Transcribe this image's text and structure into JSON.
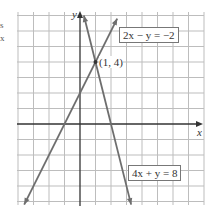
{
  "edge_fragments": [
    "s",
    "x"
  ],
  "colors": {
    "grid": "#bdbdbd",
    "axis": "#333333",
    "line": "#6e6e6e",
    "background": "#ffffff"
  },
  "chart_data": {
    "type": "line",
    "title": "",
    "xlabel": "x",
    "ylabel": "y",
    "xlim": [
      -4,
      8
    ],
    "ylim": [
      -5,
      7
    ],
    "grid": true,
    "series": [
      {
        "name": "2x − y = −2",
        "equation": "y = 2x + 2",
        "x": [
          -3.6,
          2.4
        ],
        "y": [
          -5.2,
          6.8
        ]
      },
      {
        "name": "4x + y = 8",
        "equation": "y = -4x + 8",
        "x": [
          0.25,
          3.3
        ],
        "y": [
          7.0,
          -5.2
        ]
      }
    ],
    "annotations": [
      {
        "text": "(1, 4)",
        "x": 1,
        "y": 4,
        "type": "intersection-point"
      },
      {
        "text": "2x − y = −2",
        "type": "line-label"
      },
      {
        "text": "4x + y = 8",
        "type": "line-label"
      }
    ]
  },
  "labels": {
    "line1": "2x − y = −2",
    "line2": "4x + y = 8",
    "point": "(1, 4)",
    "x_axis": "x",
    "y_axis": "y"
  }
}
